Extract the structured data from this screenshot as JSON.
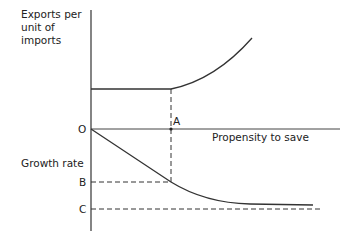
{
  "diagram": {
    "y_label_top": [
      "Exports per",
      "unit of",
      "imports"
    ],
    "y_label_bottom": "Growth rate",
    "x_label": "Propensity to save",
    "origin_label": "O",
    "point_label": "A",
    "level_labels": {
      "b": "B",
      "c": "C"
    }
  }
}
